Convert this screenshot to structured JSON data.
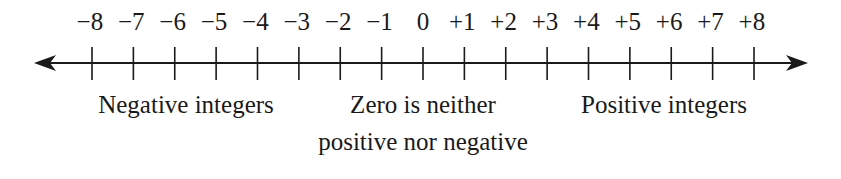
{
  "chart_data": {
    "type": "number_line",
    "min": -8,
    "max": 8,
    "step": 1,
    "tick_labels": [
      "−8",
      "−7",
      "−6",
      "−5",
      "−4",
      "−3",
      "−2",
      "−1",
      "0",
      "+1",
      "+2",
      "+3",
      "+4",
      "+5",
      "+6",
      "+7",
      "+8"
    ],
    "arrows": [
      "left",
      "right"
    ],
    "annotations": [
      {
        "text": "Negative integers",
        "region": "left"
      },
      {
        "text": "Zero is neither positive nor negative",
        "region": "center"
      },
      {
        "text": "Positive integers",
        "region": "right"
      }
    ]
  },
  "labels": {
    "negative": "Negative integers",
    "zero_line1": "Zero is neither",
    "zero_line2": "positive nor negative",
    "positive": "Positive integers"
  }
}
